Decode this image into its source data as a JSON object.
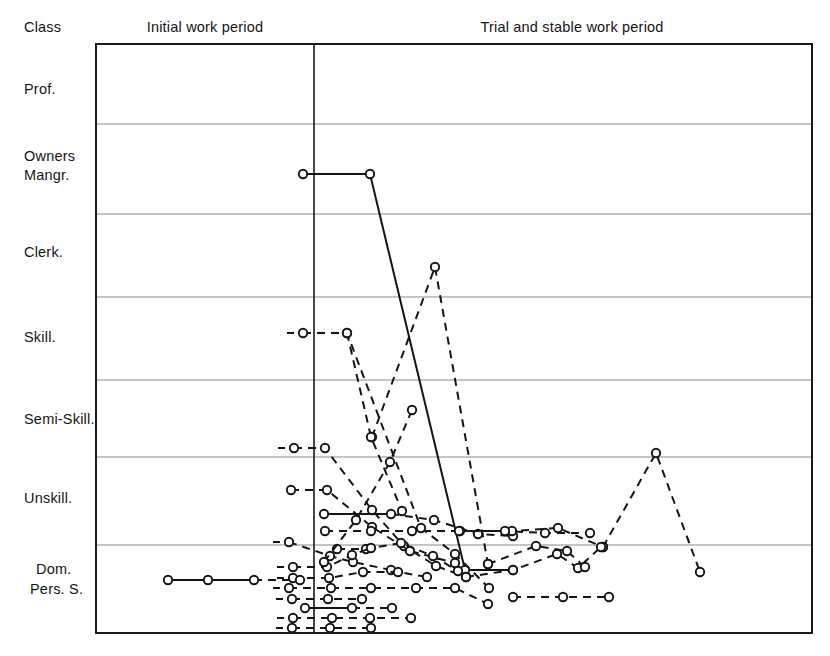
{
  "figure": {
    "background": "#ffffff",
    "ink": "#141414",
    "grid_color": "#8a8a8a",
    "frame_color": "#1a1a1a"
  },
  "axes": {
    "class_header": "Class",
    "y_label_names": [
      "Prof.",
      "Owners",
      "Mangr.",
      "Clerk.",
      "Skill.",
      "Semi-Skill.",
      "Unskill.",
      "Dom.",
      "Pers. S."
    ],
    "period_labels": [
      {
        "text": "Initial work period",
        "x": 205,
        "y": 32
      },
      {
        "text": "Trial and stable work period",
        "x": 572,
        "y": 32
      }
    ],
    "plot": {
      "left": 96,
      "right": 812,
      "top": 44,
      "bottom": 633
    },
    "divider_x": 314,
    "gridlines_y": [
      124,
      214,
      297,
      380,
      457,
      545
    ],
    "band_labels": [
      {
        "text": "Prof.",
        "x": 24,
        "y": 94
      },
      {
        "text": "Owners",
        "x": 24,
        "y": 161
      },
      {
        "text": "Mangr.",
        "x": 24,
        "y": 180
      },
      {
        "text": "Clerk.",
        "x": 24,
        "y": 257
      },
      {
        "text": "Skill.",
        "x": 24,
        "y": 342
      },
      {
        "text": "Semi-Skill.",
        "x": 24,
        "y": 424
      },
      {
        "text": "Unskill.",
        "x": 24,
        "y": 503
      },
      {
        "text": "Dom.",
        "x": 36,
        "y": 574
      },
      {
        "text": "Pers. S.",
        "x": 30,
        "y": 594
      }
    ]
  },
  "chart_data": {
    "type": "line",
    "title": "",
    "subtitle": "",
    "xlabel": "",
    "ylabel": "Class",
    "grid": true,
    "legend": "none",
    "categories": [
      "Prof.",
      "Owners Mangr.",
      "Clerk.",
      "Skill.",
      "Semi-Skill.",
      "Unskill.",
      "Dom. Pers. S."
    ],
    "x_sections": [
      "Initial work period",
      "Trial and stable work period"
    ],
    "series": [
      {
        "name": "case-1-solid-managerial",
        "style": "solid",
        "lead_dash": false,
        "points": [
          [
            303,
            174
          ],
          [
            370,
            174
          ],
          [
            465,
            570
          ],
          [
            513,
            570
          ]
        ]
      },
      {
        "name": "case-2-dashed-clerical-peak",
        "style": "dashed",
        "lead_dash": false,
        "points": [
          [
            372,
            437
          ],
          [
            435,
            267
          ],
          [
            488,
            564
          ]
        ]
      },
      {
        "name": "case-3-dashed-skilled-descent",
        "style": "dashed",
        "lead_dash": true,
        "points": [
          [
            303,
            333
          ],
          [
            347,
            333
          ],
          [
            421,
            528
          ],
          [
            455,
            554
          ],
          [
            489,
            588
          ]
        ]
      },
      {
        "name": "case-4-dashed-semiskill-fall",
        "style": "dashed",
        "lead_dash": true,
        "points": [
          [
            294,
            448
          ],
          [
            325,
            448
          ],
          [
            372,
            510
          ],
          [
            404,
            546
          ],
          [
            436,
            566
          ],
          [
            466,
            577
          ]
        ]
      },
      {
        "name": "case-5-dashed-unskill-flat",
        "style": "dashed",
        "lead_dash": false,
        "points": [
          [
            291,
            490
          ],
          [
            327,
            490
          ],
          [
            372,
            527
          ],
          [
            410,
            551
          ],
          [
            455,
            563
          ]
        ]
      },
      {
        "name": "case-6-solid-unskill-run",
        "style": "solid",
        "lead_dash": false,
        "points": [
          [
            324,
            514
          ],
          [
            391,
            514
          ]
        ],
        "tail_dashed_points": [
          [
            391,
            514
          ],
          [
            434,
            520
          ],
          [
            478,
            534
          ],
          [
            513,
            536
          ]
        ]
      },
      {
        "name": "case-7-dashed-unskill-long",
        "style": "dashed",
        "lead_dash": false,
        "points": [
          [
            325,
            531
          ],
          [
            371,
            531
          ],
          [
            412,
            531
          ],
          [
            460,
            531
          ],
          [
            512,
            531
          ],
          [
            558,
            528
          ],
          [
            603,
            547
          ]
        ]
      },
      {
        "name": "case-8-dashed-right-peak",
        "style": "dashed",
        "lead_dash": false,
        "points": [
          [
            603,
            547
          ],
          [
            656,
            453
          ],
          [
            700,
            572
          ]
        ]
      },
      {
        "name": "case-9-dashed-semiskill-slope",
        "style": "dashed",
        "lead_dash": true,
        "points": [
          [
            289,
            542
          ],
          [
            330,
            556
          ],
          [
            353,
            562
          ],
          [
            391,
            570
          ]
        ]
      },
      {
        "name": "case-10-dashed-mid-cluster",
        "style": "dashed",
        "lead_dash": false,
        "points": [
          [
            337,
            549
          ],
          [
            366,
            549
          ],
          [
            401,
            543
          ],
          [
            433,
            556
          ],
          [
            458,
            571
          ]
        ]
      },
      {
        "name": "case-11-dashed-dompers-a",
        "style": "dashed",
        "lead_dash": true,
        "points": [
          [
            293,
            567
          ],
          [
            327,
            567
          ],
          [
            352,
            555
          ],
          [
            371,
            548
          ]
        ]
      },
      {
        "name": "case-12-dashed-dompers-b",
        "style": "dashed",
        "lead_dash": true,
        "points": [
          [
            293,
            578
          ],
          [
            329,
            578
          ],
          [
            363,
            572
          ],
          [
            398,
            572
          ],
          [
            427,
            577
          ]
        ]
      },
      {
        "name": "case-13-solid-dompers-lead",
        "style": "solid",
        "lead_dash": false,
        "points": [
          [
            168,
            580
          ],
          [
            208,
            580
          ],
          [
            254,
            580
          ]
        ],
        "tail_dashed_points": [
          [
            254,
            580
          ],
          [
            300,
            580
          ]
        ]
      },
      {
        "name": "case-14-dashed-dompers-c",
        "style": "dashed",
        "lead_dash": true,
        "points": [
          [
            289,
            588
          ],
          [
            331,
            588
          ],
          [
            371,
            588
          ],
          [
            416,
            588
          ],
          [
            455,
            588
          ],
          [
            488,
            604
          ]
        ]
      },
      {
        "name": "case-15-dashed-dompers-d",
        "style": "dashed",
        "lead_dash": true,
        "points": [
          [
            292,
            599
          ],
          [
            328,
            599
          ],
          [
            362,
            599
          ]
        ]
      },
      {
        "name": "case-16-solid-dompers-e",
        "style": "solid",
        "lead_dash": false,
        "points": [
          [
            305,
            608
          ],
          [
            352,
            608
          ]
        ],
        "tail_dashed_points": [
          [
            352,
            608
          ],
          [
            392,
            608
          ]
        ]
      },
      {
        "name": "case-17-dashed-dompers-f",
        "style": "dashed",
        "lead_dash": true,
        "points": [
          [
            293,
            618
          ],
          [
            332,
            618
          ],
          [
            370,
            618
          ],
          [
            411,
            618
          ]
        ]
      },
      {
        "name": "case-18-dashed-dompers-g",
        "style": "dashed",
        "lead_dash": true,
        "points": [
          [
            292,
            628
          ],
          [
            330,
            628
          ],
          [
            371,
            628
          ]
        ]
      },
      {
        "name": "case-19-dashed-right-low",
        "style": "dashed",
        "lead_dash": false,
        "points": [
          [
            513,
            597
          ],
          [
            563,
            597
          ],
          [
            609,
            597
          ]
        ]
      },
      {
        "name": "case-20-dashed-mid-right",
        "style": "dashed",
        "lead_dash": false,
        "points": [
          [
            466,
            577
          ],
          [
            513,
            570
          ],
          [
            557,
            554
          ],
          [
            578,
            568
          ],
          [
            601,
            547
          ]
        ]
      },
      {
        "name": "case-21-dashed-cross-up",
        "style": "dashed",
        "lead_dash": false,
        "points": [
          [
            347,
            333
          ],
          [
            371,
            437
          ],
          [
            402,
            511
          ]
        ]
      },
      {
        "name": "case-22-dashed-steep-up",
        "style": "dashed",
        "lead_dash": false,
        "points": [
          [
            324,
            562
          ],
          [
            356,
            520
          ],
          [
            390,
            462
          ],
          [
            412,
            410
          ]
        ]
      },
      {
        "name": "case-23-dashed-descent-right",
        "style": "dashed",
        "lead_dash": false,
        "points": [
          [
            488,
            564
          ],
          [
            536,
            546
          ],
          [
            567,
            551
          ],
          [
            585,
            567
          ]
        ]
      },
      {
        "name": "case-24-dashed-tail-right",
        "style": "dashed",
        "lead_dash": false,
        "points": [
          [
            459,
            531
          ],
          [
            505,
            531
          ],
          [
            545,
            533
          ],
          [
            590,
            533
          ]
        ]
      }
    ]
  }
}
